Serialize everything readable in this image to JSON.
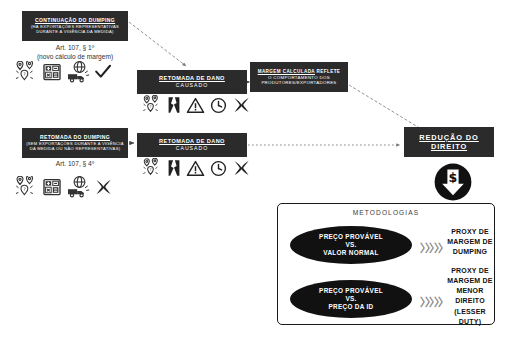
{
  "diagram": {
    "title_absent": "",
    "boxes": {
      "continuacao_dumping": {
        "heading": "CONTINUAÇÃO DO DUMPING",
        "subtext": "(HÁ EXPORTAÇÕES REPRESENTATIVAS DURANTE A VIGÊNCIA DA MEDIDA)"
      },
      "retomada_dumping": {
        "heading": "RETOMADA DO DUMPING",
        "subtext": "(SEM EXPORTAÇÕES DURANTE A VIGÊNCIA DA MEDIDA OU NÃO REPRESENTATIVAS)"
      },
      "dano_top": {
        "heading": "RETOMADA DE DANO",
        "subtext": "CAUSADO"
      },
      "dano_bottom": {
        "heading": "RETOMADA DE DANO",
        "subtext": "CAUSADO"
      },
      "margem_calculada": {
        "heading": "MARGEM CALCULADA",
        "heading_rest": " REFLETE",
        "subtext": "O COMPORTAMENTO DOS PRODUTORES/EXPORTADORES"
      },
      "reducao_direito": {
        "heading": "REDUÇÃO DO DIREITO"
      }
    },
    "captions": {
      "art_107_p1": "Art. 107, § 1º\n(novo cálculo de margem)",
      "art_107_p4": "Art. 107, § 4º"
    },
    "icon_rows": {
      "row_continuacao": [
        "map-pins-icon",
        "calculator-icon",
        "global-shipping-icon",
        "check-mark-icon"
      ],
      "row_dano_top": [
        "map-pins-icon",
        "broken-chart-icon",
        "warning-triangle-icon",
        "clock-icon",
        "x-mark-icon"
      ],
      "row_retomada": [
        "map-pins-icon",
        "calculator-icon",
        "global-shipping-icon",
        "x-mark-icon"
      ],
      "row_dano_bottom": [
        "map-pins-icon",
        "broken-chart-icon",
        "warning-triangle-icon",
        "clock-icon",
        "x-mark-icon"
      ]
    },
    "badge": {
      "name": "dollar-down-arrow-icon",
      "symbol": "$"
    },
    "methodologies": {
      "panel_title": "METODOLOGIAS",
      "rows": [
        {
          "ellipse": "PREÇO PROVÁVEL\nVS.\nVALOR NORMAL",
          "arrow": "〉〉〉〉〉",
          "result": "PROXY DE MARGEM DE DUMPING"
        },
        {
          "ellipse": "PREÇO PROVÁVEL\nVS.\nPREÇO DA ID",
          "arrow": "〉〉〉〉〉",
          "result": "PROXY DE MARGEM DE MENOR DIREITO (LESSER DUTY)"
        }
      ]
    },
    "colors": {
      "box_fill": "#2b2b2b",
      "ellipse_fill": "#111111",
      "panel_border": "#1a1a1a",
      "connector": "#555555",
      "background": "#ffffff"
    }
  }
}
